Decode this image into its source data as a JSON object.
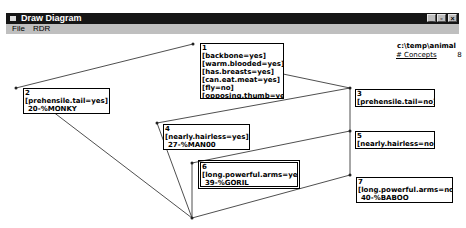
{
  "window": {
    "title": "Draw Diagram",
    "controls": [
      "minimize",
      "maximize",
      "close"
    ]
  },
  "menu": [
    "File",
    "RDR"
  ],
  "info": {
    "path": "c:\\temp\\animal",
    "concepts_label": "# Concepts",
    "concepts_count": "8"
  },
  "nodes": [
    {
      "id": "1",
      "conditions": [
        "[backbone=yes]",
        "[warm.blooded=yes]",
        "[has.breasts=yes]",
        "[can.eat.meat=yes]",
        "[fly=no]",
        "[opposing.thumb=yes"
      ],
      "conclusion": ""
    },
    {
      "id": "2",
      "conditions": [
        "[prehensile.tail=yes]"
      ],
      "conclusion": "20-%MONKY"
    },
    {
      "id": "3",
      "conditions": [
        "[prehensile.tail=no]"
      ],
      "conclusion": ""
    },
    {
      "id": "4",
      "conditions": [
        "[nearly.hairless=yes]"
      ],
      "conclusion": "27-%MAN00"
    },
    {
      "id": "5",
      "conditions": [
        "[nearly.hairless=no]"
      ],
      "conclusion": ""
    },
    {
      "id": "6",
      "conditions": [
        "[long.powerful.arms=yes]"
      ],
      "conclusion": "39-%GORIL",
      "selected": true
    },
    {
      "id": "7",
      "conditions": [
        "[long.powerful.arms=no]"
      ],
      "conclusion": "40-%BABOO"
    }
  ],
  "edges": [
    [
      "1",
      "2"
    ],
    [
      "1",
      "3"
    ],
    [
      "3",
      "4"
    ],
    [
      "3",
      "5"
    ],
    [
      "5",
      "6"
    ],
    [
      "5",
      "7"
    ],
    [
      "2",
      "end"
    ],
    [
      "4",
      "end"
    ],
    [
      "6",
      "end"
    ],
    [
      "7",
      "end"
    ]
  ]
}
